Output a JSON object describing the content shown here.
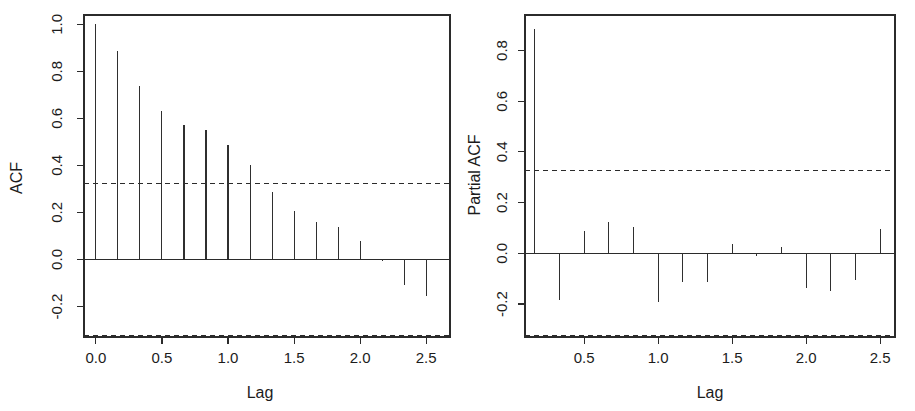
{
  "figure": {
    "background": "#ffffff",
    "foreground": "#2b2b2b",
    "width": 915,
    "height": 411
  },
  "chart_data": [
    {
      "type": "bar",
      "name": "acf-plot",
      "title": "",
      "xlabel": "Lag",
      "ylabel": "ACF",
      "xlim": [
        -0.09,
        2.68
      ],
      "ylim": [
        -0.33,
        1.04
      ],
      "xticks": [
        "0.0",
        "0.5",
        "1.0",
        "1.5",
        "2.0",
        "2.5"
      ],
      "xtick_values": [
        0.0,
        0.5,
        1.0,
        1.5,
        2.0,
        2.5
      ],
      "yticks": [
        "1.0",
        "0.8",
        "0.6",
        "0.4",
        "0.2",
        "0.0",
        "-0.2"
      ],
      "ytick_values": [
        1.0,
        0.8,
        0.6,
        0.4,
        0.2,
        0.0,
        -0.2
      ],
      "grid": false,
      "legend": "none",
      "confidence_bounds": [
        0.325,
        -0.325
      ],
      "confidence_style": "dashed",
      "x": [
        0.0,
        0.1667,
        0.3333,
        0.5,
        0.6667,
        0.8333,
        1.0,
        1.1667,
        1.3333,
        1.5,
        1.6667,
        1.8333,
        2.0,
        2.1667,
        2.3333,
        2.5
      ],
      "values": [
        1.0,
        0.885,
        0.74,
        0.63,
        0.57,
        0.55,
        0.485,
        0.4,
        0.285,
        0.205,
        0.16,
        0.14,
        0.08,
        -0.005,
        -0.11,
        -0.155
      ]
    },
    {
      "type": "bar",
      "name": "pacf-plot",
      "title": "",
      "xlabel": "Lag",
      "ylabel": "Partial ACF",
      "xlim": [
        0.1,
        2.6
      ],
      "ylim": [
        -0.33,
        0.94
      ],
      "xticks": [
        "0.5",
        "1.0",
        "1.5",
        "2.0",
        "2.5"
      ],
      "xtick_values": [
        0.5,
        1.0,
        1.5,
        2.0,
        2.5
      ],
      "yticks": [
        "0.8",
        "0.6",
        "0.4",
        "0.2",
        "0.0",
        "-0.2"
      ],
      "ytick_values": [
        0.8,
        0.6,
        0.4,
        0.2,
        0.0,
        -0.2
      ],
      "grid": false,
      "legend": "none",
      "confidence_bounds": [
        0.325,
        -0.325
      ],
      "confidence_style": "dashed",
      "x": [
        0.1667,
        0.3333,
        0.5,
        0.6667,
        0.8333,
        1.0,
        1.1667,
        1.3333,
        1.5,
        1.6667,
        1.8333,
        2.0,
        2.1667,
        2.3333,
        2.5
      ],
      "values": [
        0.885,
        -0.185,
        0.09,
        0.125,
        0.105,
        -0.19,
        -0.115,
        -0.115,
        0.035,
        -0.01,
        0.025,
        -0.135,
        -0.15,
        -0.105,
        0.095
      ]
    }
  ]
}
